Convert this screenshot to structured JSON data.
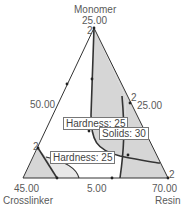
{
  "diagram": {
    "type": "ternary-contour-plot",
    "vertices": {
      "top": {
        "name": "Monomer",
        "value": "25.00"
      },
      "bottom_left": {
        "name": "Crosslinker",
        "value": "45.00"
      },
      "bottom_right": {
        "name": "Resin",
        "value": "70.00"
      }
    },
    "edge_labels": {
      "left": "50.00",
      "right": "25.00",
      "bottom": "5.00"
    },
    "point_markers": [
      "2",
      "2",
      "2",
      "2"
    ],
    "contours": [
      {
        "label": "Hardness: 25"
      },
      {
        "label": "Solids: 30"
      },
      {
        "label": "Hardness: 25"
      }
    ],
    "colors": {
      "shade": "#d6d6d6",
      "line": "#333333",
      "text": "#5a5a5a"
    }
  }
}
